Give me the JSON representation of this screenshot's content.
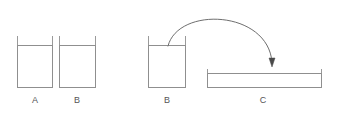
{
  "canvas": {
    "width": 338,
    "height": 117,
    "background": "#ffffff"
  },
  "style": {
    "stroke_color": "#8f8f8f",
    "stroke_color_dark": "#707070",
    "arrow_color": "#555555",
    "label_color": "#555555",
    "stroke_width": 1,
    "label_font_size": 9
  },
  "diagram": {
    "type": "container-transfer",
    "vessels": [
      {
        "id": "vessel-a",
        "label": "A",
        "shape": "tall-open-container",
        "x": 17,
        "y": 45,
        "width": 36,
        "height": 43,
        "wall_top": 36,
        "label_x": 35,
        "label_y": 103
      },
      {
        "id": "vessel-b-left",
        "label": "B",
        "shape": "tall-open-container",
        "x": 59,
        "y": 45,
        "width": 37,
        "height": 43,
        "wall_top": 36,
        "label_x": 77,
        "label_y": 103
      },
      {
        "id": "vessel-b-source",
        "label": "B",
        "shape": "tall-open-container",
        "x": 148,
        "y": 45,
        "width": 38,
        "height": 43,
        "wall_top": 36,
        "label_x": 167,
        "label_y": 103
      },
      {
        "id": "vessel-c",
        "label": "C",
        "shape": "wide-shallow-container",
        "x": 207,
        "y": 73,
        "width": 115,
        "height": 15,
        "wall_top": 69,
        "label_x": 263,
        "label_y": 103
      }
    ],
    "arrow": {
      "id": "transfer-arrow",
      "kind": "curved-arc",
      "from_vessel": "vessel-b-source",
      "to_vessel": "vessel-c",
      "start_x": 168,
      "start_y": 46,
      "end_x": 272,
      "end_y": 64,
      "control1_x": 178,
      "control1_y": 6,
      "control2_x": 268,
      "control2_y": 10,
      "arrowhead_width": 6,
      "arrowhead_height": 8
    }
  }
}
